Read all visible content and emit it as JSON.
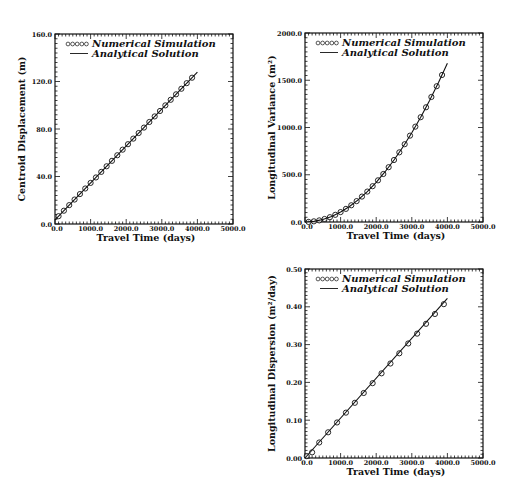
{
  "chart_data": [
    {
      "id": "centroid",
      "type": "line",
      "title": "",
      "xlabel": "Travel Time (days)",
      "ylabel": "Centroid Displacement (m)",
      "xlim": [
        0,
        5000
      ],
      "ylim": [
        0,
        160
      ],
      "xticks": [
        "0.0",
        "1000.0",
        "2000.0",
        "3000.0",
        "4000.0",
        "5000.0"
      ],
      "yticks": [
        "0.0",
        "40.0",
        "80.0",
        "120.0",
        "160.0"
      ],
      "legend": {
        "position": "upper-left",
        "entries": [
          "Numerical Simulation",
          "Analytical Solution"
        ]
      },
      "series": [
        {
          "name": "Numerical Simulation",
          "style": "circles",
          "x": [
            100,
            250,
            400,
            550,
            700,
            850,
            1000,
            1150,
            1300,
            1450,
            1600,
            1750,
            1900,
            2050,
            2200,
            2350,
            2500,
            2650,
            2800,
            2950,
            3100,
            3250,
            3400,
            3550,
            3700,
            3850
          ],
          "y": [
            6.6,
            11.2,
            15.9,
            20.6,
            25.2,
            29.9,
            34.6,
            39.2,
            43.9,
            48.6,
            53.2,
            57.9,
            62.6,
            67.2,
            71.9,
            76.6,
            81.2,
            85.9,
            90.6,
            95.2,
            99.9,
            104.6,
            109.2,
            113.9,
            118.6,
            123.2
          ]
        },
        {
          "name": "Analytical Solution",
          "style": "line",
          "x": [
            0,
            4000
          ],
          "y": [
            3.5,
            127.9
          ]
        }
      ]
    },
    {
      "id": "variance",
      "type": "line",
      "title": "",
      "xlabel": "Travel Time (days)",
      "ylabel": "Longitudinal Variance (m²)",
      "xlim": [
        0,
        5000
      ],
      "ylim": [
        0,
        2000
      ],
      "xticks": [
        "0.0",
        "1000.0",
        "2000.0",
        "3000.0",
        "4000.0",
        "5000.0"
      ],
      "yticks": [
        "0.0",
        "500.0",
        "1000.0",
        "1500.0",
        "2000.0"
      ],
      "legend": {
        "position": "upper-left",
        "entries": [
          "Numerical Simulation",
          "Analytical Solution"
        ]
      },
      "series": [
        {
          "name": "Numerical Simulation",
          "style": "circles",
          "x": [
            100,
            250,
            400,
            550,
            700,
            850,
            1000,
            1150,
            1300,
            1450,
            1600,
            1750,
            1900,
            2050,
            2200,
            2350,
            2500,
            2650,
            2800,
            2950,
            3100,
            3250,
            3400,
            3550,
            3700,
            3850
          ],
          "y": [
            1,
            7,
            17,
            32,
            51,
            76,
            105,
            139,
            177,
            221,
            269,
            322,
            379,
            441,
            508,
            580,
            656,
            737,
            823,
            914,
            1009,
            1109,
            1214,
            1323,
            1437,
            1556
          ]
        },
        {
          "name": "Analytical Solution",
          "style": "line",
          "x": [
            0,
            250,
            500,
            750,
            1000,
            1250,
            1500,
            1750,
            2000,
            2250,
            2500,
            2750,
            3000,
            3250,
            3500,
            3750,
            4000
          ],
          "y": [
            0,
            7,
            26,
            59,
            105,
            164,
            236,
            322,
            420,
            532,
            656,
            794,
            945,
            1109,
            1286,
            1477,
            1680
          ]
        }
      ]
    },
    {
      "id": "dispersion",
      "type": "line",
      "title": "",
      "xlabel": "Travel Time (days)",
      "ylabel": "Longitudinal Dispersion (m²/day)",
      "xlim": [
        0,
        5000
      ],
      "ylim": [
        0,
        0.5
      ],
      "xticks": [
        "0.0",
        "1000.0",
        "2000.0",
        "3000.0",
        "4000.0",
        "5000.0"
      ],
      "yticks": [
        "0.00",
        "0.10",
        "0.20",
        "0.30",
        "0.40",
        "0.50"
      ],
      "legend": {
        "position": "upper-left",
        "entries": [
          "Numerical Simulation",
          "Analytical Solution"
        ]
      },
      "series": [
        {
          "name": "Numerical Simulation",
          "style": "circles",
          "x": [
            50,
            200,
            400,
            650,
            900,
            1150,
            1400,
            1650,
            1900,
            2150,
            2400,
            2650,
            2900,
            3150,
            3400,
            3650,
            3900
          ],
          "y": [
            0.005,
            0.015,
            0.041,
            0.068,
            0.094,
            0.12,
            0.146,
            0.172,
            0.198,
            0.224,
            0.25,
            0.277,
            0.303,
            0.329,
            0.355,
            0.381,
            0.407
          ]
        },
        {
          "name": "Analytical Solution",
          "style": "line",
          "x": [
            0,
            4000
          ],
          "y": [
            0.0,
            0.422
          ]
        }
      ]
    }
  ],
  "labels": {
    "legend_numerical": "Numerical Simulation",
    "legend_analytical": "Analytical Solution",
    "legend_circles": "ooooo",
    "xlabel": "Travel Time (days)",
    "ylabel_centroid": "Centroid Displacement (m)",
    "ylabel_variance": "Longitudinal Variance (m²)",
    "ylabel_dispersion": "Longitudinal Dispersion (m²/day)"
  }
}
